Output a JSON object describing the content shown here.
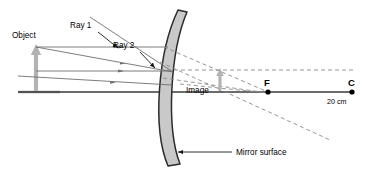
{
  "diagram": {
    "type": "convex-mirror-ray-diagram",
    "title_text": "",
    "labels": {
      "object": "Object",
      "ray1": "Ray 1",
      "ray2": "Ray 2",
      "image": "Image",
      "focal_point": "F",
      "center_of_curvature": "C",
      "distance": "20 cm",
      "mirror_surface": "Mirror surface"
    },
    "colors": {
      "axis": "#1a1a1a",
      "ray": "#6e6e6e",
      "dashed": "#8a8a8a",
      "mirror_fill": "#c9c9c9",
      "mirror_stroke": "#2b2b2b",
      "object_arrow": "#b3b3b3",
      "image_arrow": "#b3b3b3",
      "text": "#000000",
      "background": "#ffffff"
    },
    "geometry": {
      "principal_axis_y": 92,
      "axis_x_start": 18,
      "axis_x_end": 355,
      "object_x": 36,
      "object_top_y": 46,
      "image_x": 220,
      "image_top_y": 70,
      "focal_point_x": 268,
      "focal_point_y": 92,
      "center_x": 352,
      "center_y": 92,
      "mirror_vertex_x": 172,
      "mirror_top_y": 10,
      "mirror_bottom_y": 166
    }
  }
}
